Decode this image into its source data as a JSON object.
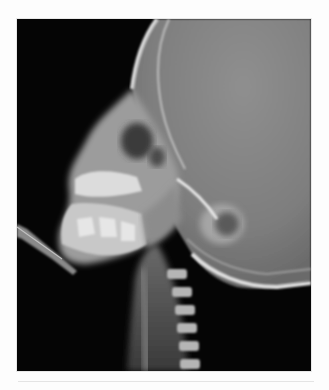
{
  "figure": {
    "orientation": "face-left",
    "background_color": "#fdfdfd",
    "image_background": "#050505",
    "bone_tone": "#cfcfcf",
    "cranium_tone": "#8a8a8a"
  }
}
